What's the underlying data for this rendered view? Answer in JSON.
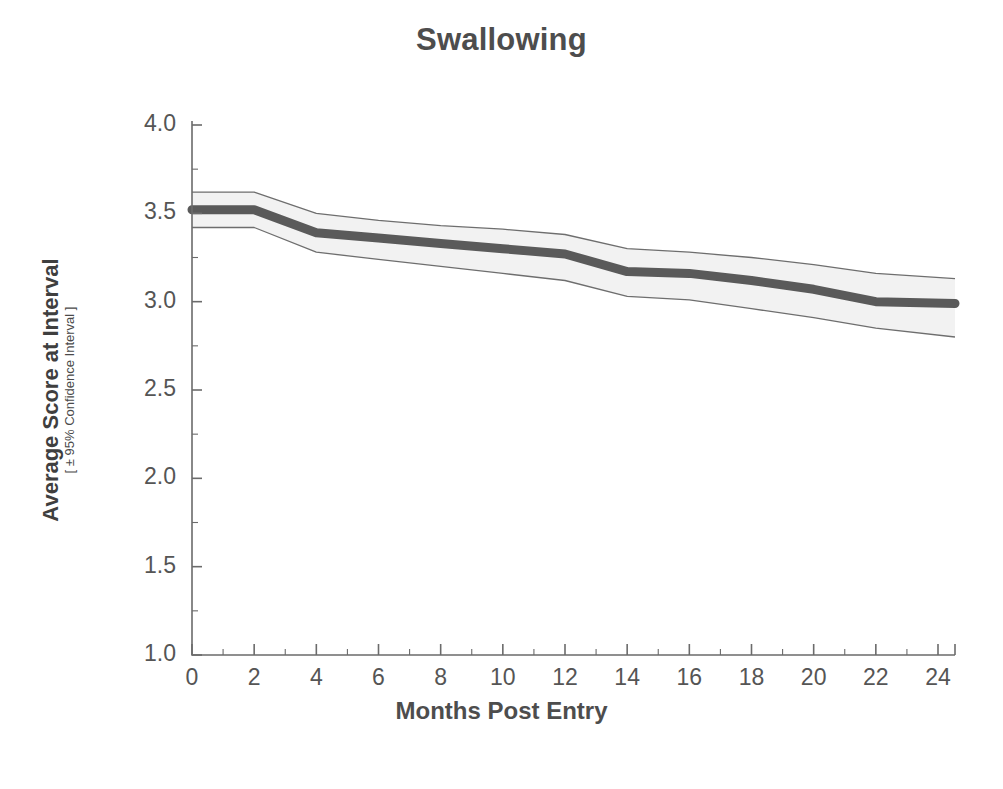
{
  "chart_data": {
    "type": "line",
    "title": "Swallowing",
    "xlabel": "Months Post Entry",
    "ylabel": "Average Score at Interval",
    "ylabel_sub": "[ ± 95% Confidence Interval ]",
    "xlim": [
      0,
      24
    ],
    "ylim": [
      1.0,
      4.0
    ],
    "grid": false,
    "legend": "none",
    "x_ticks": [
      0,
      2,
      4,
      6,
      8,
      10,
      12,
      14,
      16,
      18,
      20,
      22,
      24
    ],
    "x_tick_labels": [
      "0",
      "2",
      "4",
      "6",
      "8",
      "10",
      "12",
      "14",
      "16",
      "18",
      "20",
      "22",
      "24"
    ],
    "x_minor_ticks": [
      1,
      3,
      5,
      7,
      9,
      11,
      13,
      15,
      17,
      19,
      21,
      23
    ],
    "y_ticks": [
      1.0,
      1.5,
      2.0,
      2.5,
      3.0,
      3.5,
      4.0
    ],
    "y_tick_labels": [
      "1.0",
      "1.5",
      "2.0",
      "2.5",
      "3.0",
      "3.5",
      "4.0"
    ],
    "x": [
      0,
      2,
      4,
      6,
      8,
      10,
      12,
      14,
      16,
      18,
      20,
      22,
      24
    ],
    "series": [
      {
        "name": "Average Score",
        "values": [
          3.52,
          3.52,
          3.39,
          3.36,
          3.33,
          3.3,
          3.27,
          3.17,
          3.16,
          3.12,
          3.07,
          3.0,
          2.99
        ],
        "ci_upper": [
          3.62,
          3.62,
          3.5,
          3.46,
          3.43,
          3.41,
          3.38,
          3.3,
          3.28,
          3.25,
          3.21,
          3.16,
          3.13
        ],
        "ci_lower": [
          3.42,
          3.42,
          3.28,
          3.24,
          3.2,
          3.16,
          3.12,
          3.03,
          3.01,
          2.96,
          2.91,
          2.85,
          2.8
        ],
        "color": "#5a5a5a",
        "band_fill": "#f2f2f2",
        "band_stroke": "#6e6e6e"
      }
    ]
  },
  "colors": {
    "axis": "#6b6b6b",
    "text": "#4d4d4d",
    "line": "#5a5a5a",
    "band_fill": "#f2f2f2",
    "band_edge": "#707070",
    "background": "#ffffff"
  }
}
